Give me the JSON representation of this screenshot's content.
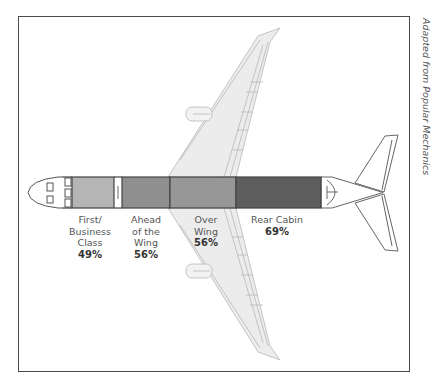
{
  "diagram": {
    "colors": {
      "first_business": "#b5b5b5",
      "ahead_of_wing": "#8f8f8f",
      "over_wing": "#979797",
      "rear_cabin": "#5e5e5e",
      "wing_fill": "#ececec",
      "outline": "#444444"
    },
    "sections": [
      {
        "id": "first-business",
        "lines": [
          "First/",
          "Business",
          "Class"
        ],
        "percent": "49%"
      },
      {
        "id": "ahead-of-wing",
        "lines": [
          "Ahead",
          "of the",
          "Wing"
        ],
        "percent": "56%"
      },
      {
        "id": "over-wing",
        "lines": [
          "Over",
          "Wing"
        ],
        "percent": "56%"
      },
      {
        "id": "rear-cabin",
        "lines": [
          "Rear Cabin"
        ],
        "percent": "69%"
      }
    ],
    "credit": "Adapted from Popular Mechanics"
  }
}
